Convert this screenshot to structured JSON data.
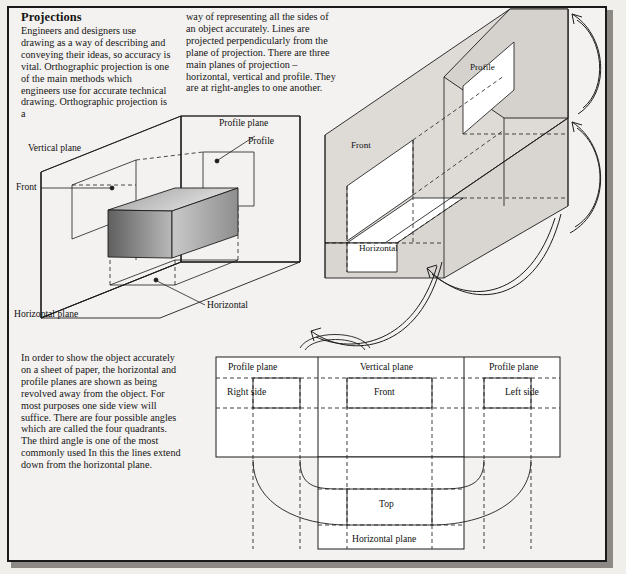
{
  "page": {
    "background_color": "#f1efec",
    "frame_color": "#1a1a1a",
    "width": 626,
    "height": 574
  },
  "article": {
    "title": "Projections",
    "column_left": "Engineers and designers use drawing as a way of describing and conveying their ideas, so accuracy is vital. Orthographic projection is one of the main methods which engineers use for accurate technical drawing. Orthographic projection is a",
    "column_right": "way of representing all the sides of an object accurately. Lines are projected perpendicularly from the plane of projection. There are three main planes of projection – horizontal, vertical and profile. They are at right-angles to one another.",
    "column_lower": "In order to show the object accurately on a sheet of paper, the horizontal and profile planes are shown as being revolved away from the object. For most purposes one side view will suffice. There are four possible angles which are called the four quadrants. The third angle is one of the most commonly used In this the lines extend down from the horizontal plane."
  },
  "figure_isometric": {
    "name": "three-planes-isometric",
    "labels": {
      "vertical_plane": "Vertical plane",
      "profile_plane": "Profile plane",
      "profile": "Profile",
      "front": "Front",
      "horizontal": "Horizontal",
      "horizontal_plane": "Horizontal plane"
    },
    "solid_fill_dark": "#6e6e6e",
    "solid_fill_light": "#d8d8d8"
  },
  "figure_unfolded": {
    "name": "planes-revolving-isometric",
    "labels": {
      "profile": "Profile",
      "front": "Front",
      "horizontal": "Horizontal"
    },
    "plane_fill": "#dedad6",
    "arrow_count": 4
  },
  "figure_layout": {
    "name": "third-angle-projection-layout",
    "headers": {
      "left_profile_plane": "Profile plane",
      "vertical_plane": "Vertical plane",
      "right_profile_plane": "Profile plane"
    },
    "views": {
      "right_side": "Right side",
      "front": "Front",
      "left_side": "Left side",
      "top": "Top",
      "horizontal_plane": "Horizontal plane"
    }
  }
}
